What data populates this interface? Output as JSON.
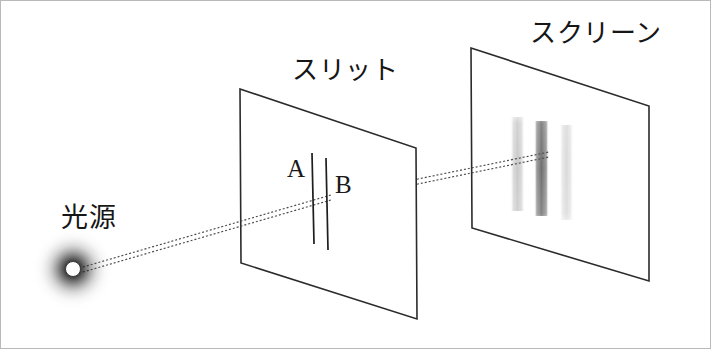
{
  "figure": {
    "background_color": "#ffffff",
    "border_color": "#b9b9b9",
    "width": 711,
    "height": 349
  },
  "labels": {
    "light_source": "光源",
    "slit": "スリット",
    "screen": "スクリーン",
    "slit_a": "A",
    "slit_b": "B"
  },
  "light_source": {
    "name": "light-source",
    "center_x": 72,
    "center_y": 268,
    "dot_radius": 7,
    "dot_color": "#ffffff",
    "dot_outline_color": "#2a2a2a",
    "glow_color": "#000000",
    "glow_radius": 40
  },
  "slit_panel": {
    "name": "slit-panel",
    "stroke_color": "#2b2b2b",
    "fill_color": "#ffffff",
    "corners": [
      [
        239,
        88
      ],
      [
        415,
        147
      ],
      [
        416,
        318
      ],
      [
        240,
        262
      ]
    ],
    "slits": [
      {
        "id": "A",
        "x_top": 311,
        "y_top": 152,
        "x_bottom": 313,
        "y_bottom": 243
      },
      {
        "id": "B",
        "x_top": 325,
        "y_top": 157,
        "x_bottom": 327,
        "y_bottom": 249
      }
    ]
  },
  "screen_panel": {
    "name": "screen-panel",
    "stroke_color": "#2b2b2b",
    "fill_color": "#ffffff",
    "corners": [
      [
        470,
        47
      ],
      [
        648,
        105
      ],
      [
        648,
        280
      ],
      [
        471,
        227
      ]
    ],
    "fringes": [
      {
        "id": "fringe-left",
        "x": 514,
        "y_top": 118,
        "width": 11,
        "height": 90,
        "color": "#d6d6d6",
        "opacity": 0.85
      },
      {
        "id": "fringe-center",
        "x": 538,
        "y_top": 121,
        "width": 11,
        "height": 92,
        "color": "#7f7f7f",
        "opacity": 0.95
      },
      {
        "id": "fringe-right",
        "x": 563,
        "y_top": 125,
        "width": 11,
        "height": 92,
        "color": "#e2e2e2",
        "opacity": 0.8
      }
    ]
  },
  "light_rays": {
    "name": "light-rays",
    "stroke_color": "#4a4a4a",
    "dash_pattern": "2 2",
    "stroke_width": 1.2,
    "paths": [
      {
        "id": "ray-source-to-slit-a",
        "x1": 80,
        "y1": 266,
        "x2": 313,
        "y2": 198
      },
      {
        "id": "ray-source-to-slit-b",
        "x1": 80,
        "y1": 270,
        "x2": 327,
        "y2": 203
      },
      {
        "id": "ray-slit-to-screen-upper",
        "x1": 412,
        "y1": 179,
        "x2": 546,
        "y2": 152
      },
      {
        "id": "ray-slit-to-screen-lower",
        "x1": 412,
        "y1": 184,
        "x2": 546,
        "y2": 157
      }
    ]
  }
}
